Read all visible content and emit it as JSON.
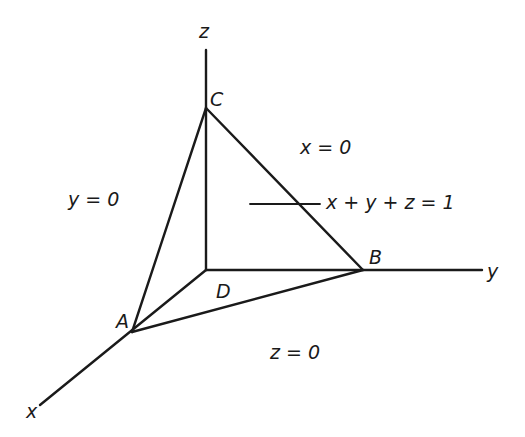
{
  "diagram": {
    "title": "",
    "axes": {
      "x": "x",
      "y": "y",
      "z": "z"
    },
    "points": {
      "A": "A",
      "B": "B",
      "C": "C",
      "D": "D"
    },
    "planes": {
      "yz_plane": "x = 0",
      "xz_plane": "y = 0",
      "xy_plane": "z = 0",
      "slanted_plane": "x + y + z = 1"
    },
    "colors": {
      "line": "#1a1a1a",
      "background": "#ffffff"
    }
  }
}
